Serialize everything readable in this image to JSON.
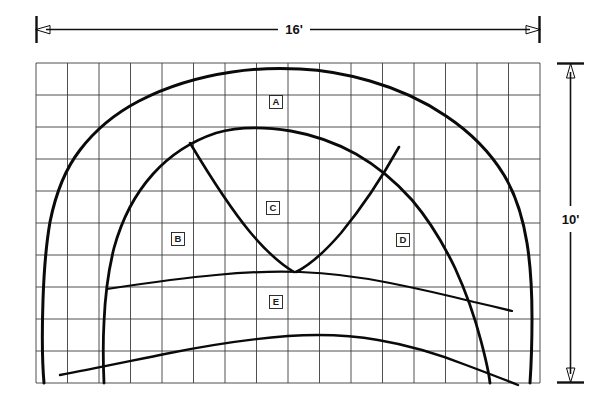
{
  "figure": {
    "background_color": "#ffffff",
    "line_color": "#0a0a0a",
    "grid_color": "#3c3c3c"
  },
  "dimensions": {
    "width_label": "16'",
    "height_label": "10'",
    "width_feet": 16,
    "height_feet": 10
  },
  "grid": {
    "columns": 16,
    "rows": 10,
    "left": 36,
    "top": 63,
    "right": 540,
    "bottom": 383,
    "cell_width": 31.5,
    "cell_height": 32.0
  },
  "zones": [
    {
      "id": "A",
      "label": "A",
      "x": 276,
      "y": 102
    },
    {
      "id": "B",
      "label": "B",
      "x": 178,
      "y": 239
    },
    {
      "id": "C",
      "label": "C",
      "x": 273,
      "y": 208
    },
    {
      "id": "D",
      "label": "D",
      "x": 403,
      "y": 240
    },
    {
      "id": "E",
      "label": "E",
      "x": 276,
      "y": 302
    }
  ],
  "features": [
    {
      "name": "outer-arch",
      "description": "Outer shelter ceiling profile",
      "stroke_width": 3.0,
      "path": "M 44 383 C 42 360 42 330 43 300 C 44 270 46 245 50 222 C 56 192 66 168 80 150 C 96 129 116 113 139 101 C 166 87 198 77 232 72 C 258 68 282 68 300 69 C 322 70 346 74 370 81 C 398 89 424 101 446 116 C 470 132 490 152 504 175 C 516 195 523 218 527 243 C 531 268 532 295 532 318 C 532 345 531 368 530 383"
    },
    {
      "name": "inner-arch",
      "description": "Inner arch / secondary ceiling profile",
      "stroke_width": 2.8,
      "path": "M 104 383 C 103 360 103 340 104 322 C 105 298 108 272 114 248 C 122 219 135 194 153 174 C 171 154 192 141 216 133 C 240 126 266 127 291 131 C 314 135 336 143 356 154 C 377 166 396 182 412 200 C 429 220 443 243 455 268 C 466 292 475 318 481 341 C 486 360 489 374 490 383"
    },
    {
      "name": "diagonal-left",
      "description": "Left diagonal running from inner arch down to V junction",
      "stroke_width": 2.6,
      "path": "M 190 143 C 205 168 226 203 250 232 C 266 251 282 265 294 272"
    },
    {
      "name": "diagonal-right",
      "description": "Right diagonal running from inner arch down to V junction",
      "stroke_width": 2.6,
      "path": "M 399 147 C 385 172 364 205 341 233 C 322 255 306 267 296 272"
    },
    {
      "name": "upper-floor-line",
      "description": "Upper floor / deposit surface line through zone E",
      "stroke_width": 2.2,
      "path": "M 107 289 C 140 284 180 278 216 275 C 248 272 276 271 300 272 C 330 273 360 277 390 283 C 420 289 450 296 474 302 C 492 306 504 309 512 311"
    },
    {
      "name": "lower-floor-line",
      "description": "Lower floor line near base of section",
      "stroke_width": 2.4,
      "path": "M 60 375 C 92 369 130 361 170 353 C 210 345 250 339 288 336 C 320 334 350 335 378 340 C 408 345 438 354 466 365 C 490 374 508 381 518 385"
    }
  ]
}
